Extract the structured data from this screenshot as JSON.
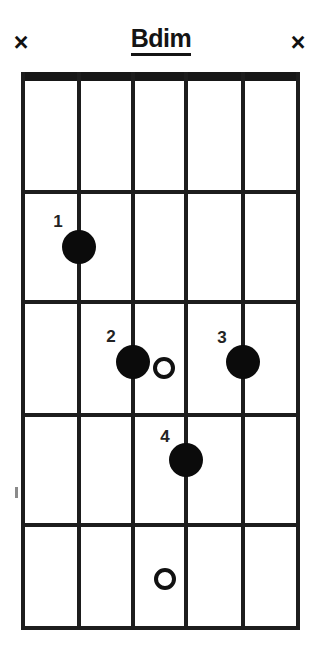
{
  "diagram": {
    "title": "Bdim",
    "instrument_strings": 6,
    "frets_shown": 5,
    "nut_shown": true
  },
  "string_markers": [
    {
      "name": "mute-string-6",
      "string": 6,
      "symbol": "×",
      "meaning": "muted"
    },
    {
      "name": "mute-string-1",
      "string": 1,
      "symbol": "×",
      "meaning": "muted"
    }
  ],
  "fingerings": [
    {
      "finger": "1",
      "string": 2,
      "fret": 2,
      "type": "filled"
    },
    {
      "finger": "2",
      "string": 3,
      "fret": 3,
      "type": "filled"
    },
    {
      "finger": "3",
      "string": 5,
      "fret": 3,
      "type": "filled"
    },
    {
      "finger": "4",
      "string": 4,
      "fret": 4,
      "type": "filled"
    }
  ],
  "open_circles": [
    {
      "name": "open-circle-fret-3",
      "fret": 3,
      "type": "hollow"
    },
    {
      "name": "open-circle-fret-5",
      "fret": 5,
      "type": "hollow"
    }
  ],
  "colors": {
    "ink": "#111111",
    "paper": "#ffffff"
  }
}
